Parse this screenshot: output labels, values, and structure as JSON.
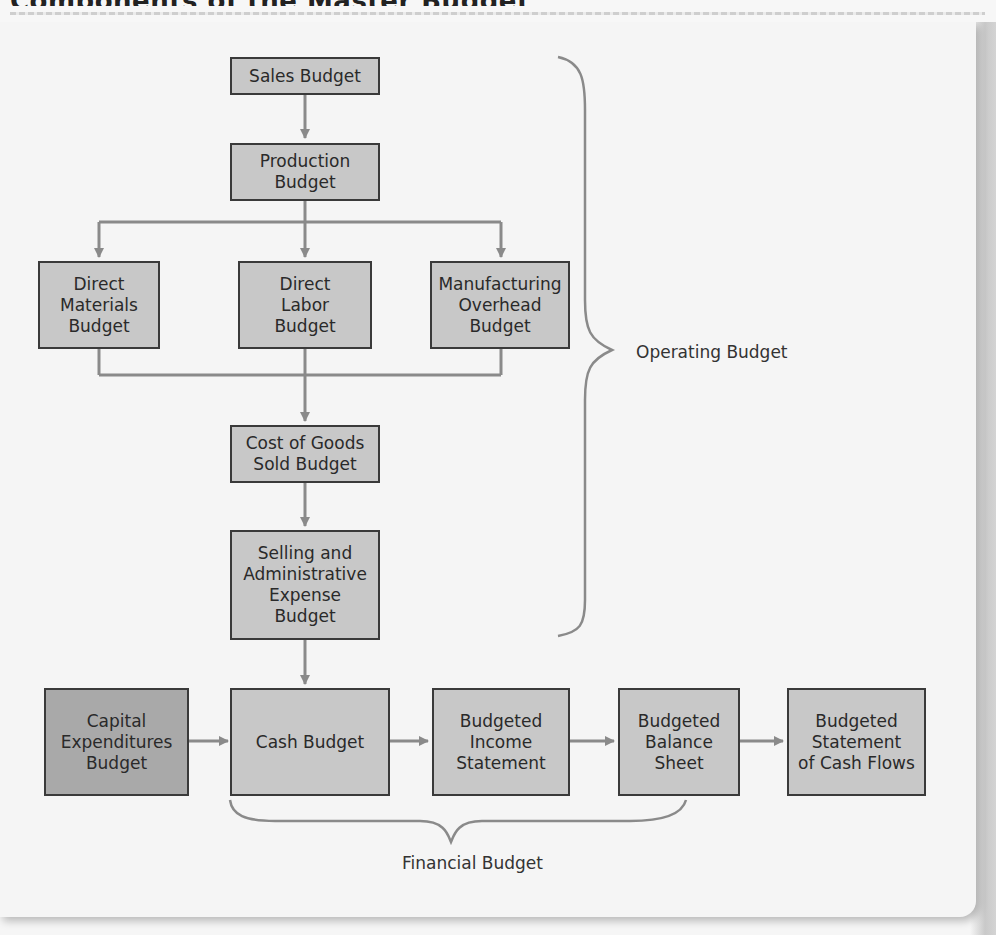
{
  "header": {
    "title_fragment": "Components of the Master Budget"
  },
  "diagram": {
    "boxes": {
      "sales": "Sales Budget",
      "production": "Production\nBudget",
      "direct_materials": "Direct\nMaterials\nBudget",
      "direct_labor": "Direct\nLabor\nBudget",
      "manufacturing_overhead": "Manufacturing\nOverhead\nBudget",
      "cogs": "Cost of Goods\nSold Budget",
      "selling_admin": "Selling and\nAdministrative\nExpense\nBudget",
      "capital_expenditures": "Capital\nExpenditures\nBudget",
      "cash": "Cash Budget",
      "income_statement": "Budgeted\nIncome\nStatement",
      "balance_sheet": "Budgeted\nBalance\nSheet",
      "cash_flows": "Budgeted\nStatement\nof Cash Flows"
    },
    "groups": {
      "operating": "Operating Budget",
      "financial": "Financial Budget"
    },
    "colors": {
      "box_fill": "#c8c8c8",
      "box_fill_dark": "#a9a9a9",
      "box_border": "#3a3a3a",
      "connector": "#8a8a8a",
      "background": "#f5f5f5"
    },
    "edges": [
      [
        "Sales Budget",
        "Production Budget"
      ],
      [
        "Production Budget",
        "Direct Materials Budget"
      ],
      [
        "Production Budget",
        "Direct Labor Budget"
      ],
      [
        "Production Budget",
        "Manufacturing Overhead Budget"
      ],
      [
        "Direct Materials Budget",
        "Cost of Goods Sold Budget"
      ],
      [
        "Direct Labor Budget",
        "Cost of Goods Sold Budget"
      ],
      [
        "Manufacturing Overhead Budget",
        "Cost of Goods Sold Budget"
      ],
      [
        "Cost of Goods Sold Budget",
        "Selling and Administrative Expense Budget"
      ],
      [
        "Selling and Administrative Expense Budget",
        "Cash Budget"
      ],
      [
        "Capital Expenditures Budget",
        "Cash Budget"
      ],
      [
        "Cash Budget",
        "Budgeted Income Statement"
      ],
      [
        "Budgeted Income Statement",
        "Budgeted Balance Sheet"
      ],
      [
        "Budgeted Balance Sheet",
        "Budgeted Statement of Cash Flows"
      ]
    ]
  }
}
